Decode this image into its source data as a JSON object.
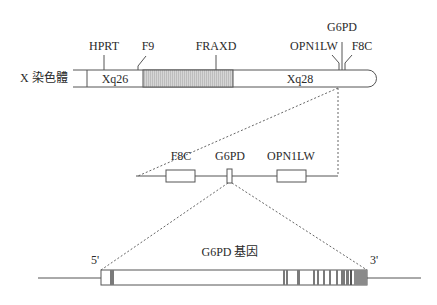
{
  "chromosome": {
    "label": "X 染色體",
    "bands": [
      {
        "name": "Xq26",
        "fill": "#ffffff"
      },
      {
        "name": "",
        "fill": "#d0d0d0",
        "hatched": true
      },
      {
        "name": "Xq28",
        "fill": "#ffffff"
      }
    ],
    "gene_markers": [
      {
        "name": "HPRT"
      },
      {
        "name": "F9"
      },
      {
        "name": "FRAXD"
      },
      {
        "name": "OPN1LW"
      },
      {
        "name": "G6PD"
      },
      {
        "name": "F8C"
      }
    ]
  },
  "region_zoom": {
    "genes": [
      {
        "name": "F8C"
      },
      {
        "name": "G6PD"
      },
      {
        "name": "OPN1LW"
      }
    ]
  },
  "gene_zoom": {
    "title": "G6PD 基因",
    "five_prime": "5'",
    "three_prime": "3'"
  },
  "colors": {
    "line": "#555555",
    "exon": "#777777",
    "hatched": "#cfcfcf",
    "utr3": "#8a8a8a"
  }
}
